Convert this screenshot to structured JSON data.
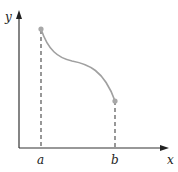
{
  "diagram": {
    "type": "function-graph",
    "axes": {
      "x_label": "x",
      "y_label": "y",
      "color": "#333333"
    },
    "curve": {
      "color": "#a0a0a0",
      "description": "decreasing curve from point above a to point above b, with an inflection near the middle"
    },
    "points": [
      {
        "label": "a",
        "color": "#a8a8a8"
      },
      {
        "label": "b",
        "color": "#a8a8a8"
      }
    ],
    "dashed_line_color": "#444444"
  }
}
